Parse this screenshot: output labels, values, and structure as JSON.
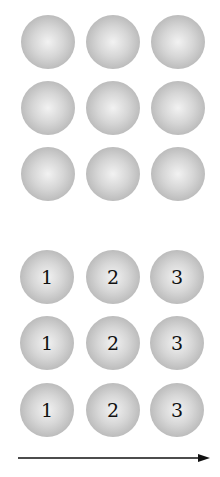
{
  "diagram": {
    "top_grid": {
      "rows": 3,
      "cols": 3,
      "labels": [
        [
          "",
          "",
          ""
        ],
        [
          "",
          "",
          ""
        ],
        [
          "",
          "",
          ""
        ]
      ]
    },
    "bottom_grid": {
      "rows": 3,
      "cols": 3,
      "labels": [
        [
          "1",
          "2",
          "3"
        ],
        [
          "1",
          "2",
          "3"
        ],
        [
          "1",
          "2",
          "3"
        ]
      ]
    },
    "arrow": {
      "direction": "right",
      "color": "#111111"
    },
    "colors": {
      "ball_light": "#f2f2f2",
      "ball_dark": "#a6a6a6"
    }
  }
}
